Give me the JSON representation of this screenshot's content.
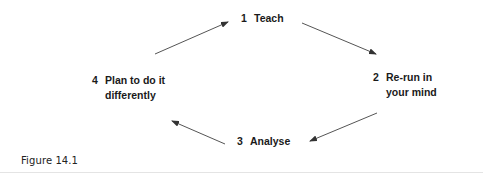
{
  "diagram": {
    "type": "cycle",
    "nodes": [
      {
        "id": "teach",
        "number": "1",
        "line1": "Teach",
        "line2": ""
      },
      {
        "id": "rerun",
        "number": "2",
        "line1": "Re-run in",
        "line2": "your mind"
      },
      {
        "id": "analyse",
        "number": "3",
        "line1": "Analyse",
        "line2": ""
      },
      {
        "id": "plan",
        "number": "4",
        "line1": "Plan to do it",
        "line2": "differently"
      }
    ],
    "edges": [
      {
        "from": "teach",
        "to": "rerun"
      },
      {
        "from": "rerun",
        "to": "analyse"
      },
      {
        "from": "analyse",
        "to": "plan"
      },
      {
        "from": "plan",
        "to": "teach"
      }
    ],
    "arrow_color": "#444444",
    "text_color": "#1a1a1a"
  },
  "caption": "Figure 14.1"
}
